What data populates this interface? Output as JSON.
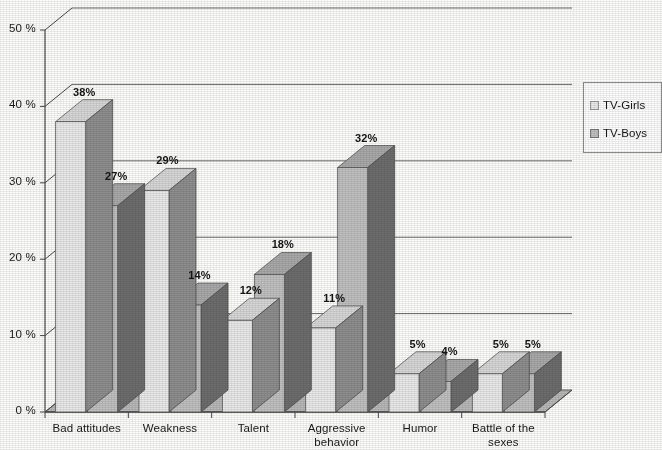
{
  "chart_data": {
    "type": "bar",
    "title": "",
    "subtitle": "",
    "xlabel": "",
    "ylabel": "",
    "categories": [
      "Bad attitudes",
      "Weakness",
      "Talent",
      "Aggressive\nbehavior",
      "Humor",
      "Battle of the\nsexes"
    ],
    "series": [
      {
        "name": "TV-Girls",
        "values": [
          38,
          29,
          12,
          11,
          5,
          5
        ],
        "color": "#e9e9e9"
      },
      {
        "name": "TV-Boys",
        "values": [
          27,
          14,
          18,
          32,
          4,
          5
        ],
        "color": "#c0c0c0"
      }
    ],
    "value_labels": [
      [
        "38%",
        "27%"
      ],
      [
        "29%",
        "14%"
      ],
      [
        "12%",
        "18%"
      ],
      [
        "11%",
        "32%"
      ],
      [
        "5%",
        "4%"
      ],
      [
        "5%",
        "5%"
      ]
    ],
    "ylim": [
      0,
      50
    ],
    "ytick_values": [
      0,
      10,
      20,
      30,
      40,
      50
    ],
    "ytick_labels": [
      "0 %",
      "10 %",
      "20 %",
      "30 %",
      "40 %",
      "50 %"
    ],
    "grid": true,
    "grid_axis": "y",
    "legend_position": "right",
    "style": "3d-column",
    "units": "percent"
  },
  "legend": {
    "entries": [
      {
        "label": "TV-Girls",
        "swatch": "#e9e9e9"
      },
      {
        "label": "TV-Boys",
        "swatch": "#c0c0c0"
      }
    ]
  },
  "colors": {
    "girls_front": "#e9e9e9",
    "girls_side": "#8e8e8e",
    "girls_top": "#d7d7d7",
    "boys_front": "#c0c0c0",
    "boys_side": "#6d6d6d",
    "boys_top": "#a9a9a9",
    "floor": "#b8b8b8",
    "floor_edge": "#5d5d5d",
    "axis": "#4a4a4a",
    "grid": "#6b6b6b",
    "text": "#191919"
  }
}
